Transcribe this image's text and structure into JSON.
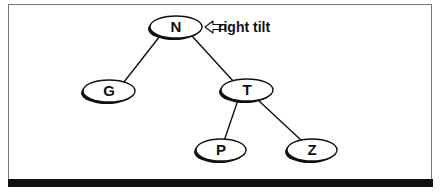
{
  "diagram": {
    "type": "binary-search-tree",
    "annotation": "right tilt",
    "annotation_target": "N",
    "nodes": [
      {
        "id": "N",
        "label": "N",
        "x": 176,
        "y": 27
      },
      {
        "id": "G",
        "label": "G",
        "x": 109,
        "y": 91
      },
      {
        "id": "T",
        "label": "T",
        "x": 247,
        "y": 90
      },
      {
        "id": "P",
        "label": "P",
        "x": 221,
        "y": 150
      },
      {
        "id": "Z",
        "label": "Z",
        "x": 312,
        "y": 150
      }
    ],
    "edges": [
      {
        "from": "N",
        "to": "G"
      },
      {
        "from": "N",
        "to": "T"
      },
      {
        "from": "T",
        "to": "P"
      },
      {
        "from": "T",
        "to": "Z"
      }
    ]
  }
}
